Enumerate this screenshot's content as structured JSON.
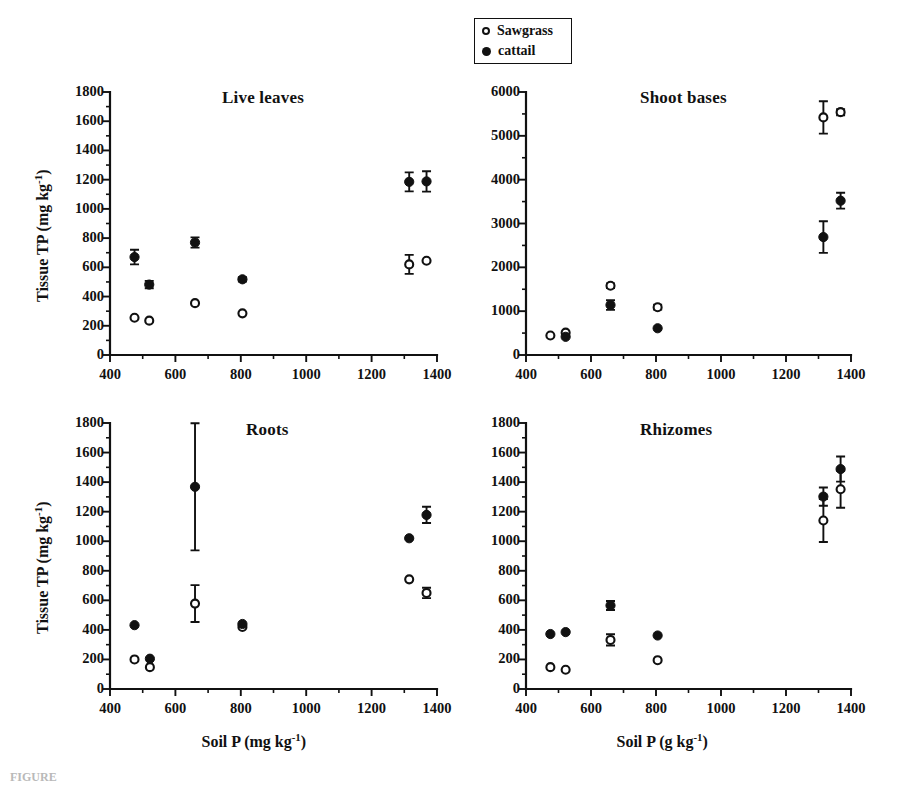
{
  "figure": {
    "caption": "FIGURE",
    "legend": {
      "items": [
        {
          "label": "Sawgrass",
          "marker": "open-circle-marker"
        },
        {
          "label": "cattail",
          "marker": "filled-circle-marker"
        }
      ]
    }
  },
  "chart_data": [
    {
      "type": "scatter",
      "panel_id": "live-leaves",
      "title": "Live leaves",
      "xlabel": "Soil P (mg kg⁻¹)",
      "ylabel": "Tissue TP (mg kg⁻¹)",
      "xlim": [
        400,
        1400
      ],
      "ylim": [
        0,
        1800
      ],
      "xticks": [
        400,
        600,
        800,
        1000,
        1200,
        1400
      ],
      "yticks": [
        0,
        200,
        400,
        600,
        800,
        1000,
        1200,
        1400,
        1600,
        1800
      ],
      "xticklabels": [
        "400",
        "600",
        "800",
        "1000",
        "1200",
        "1400"
      ],
      "yticklabels": [
        "0",
        "200",
        "400",
        "600",
        "800",
        "1000",
        "1200",
        "1400",
        "1600",
        "1800"
      ],
      "grid": false,
      "minor_ticks": true,
      "legend_position": "outside-top-center",
      "series": [
        {
          "name": "Sawgrass",
          "marker": "open-circle",
          "points": [
            {
              "x": 475,
              "y": 255,
              "err": 0
            },
            {
              "x": 520,
              "y": 235,
              "err": 0
            },
            {
              "x": 660,
              "y": 355,
              "err": 0
            },
            {
              "x": 805,
              "y": 285,
              "err": 0
            },
            {
              "x": 1315,
              "y": 620,
              "err": 65
            },
            {
              "x": 1368,
              "y": 645,
              "err": 0
            }
          ]
        },
        {
          "name": "cattail",
          "marker": "filled-circle",
          "points": [
            {
              "x": 475,
              "y": 670,
              "err": 50
            },
            {
              "x": 520,
              "y": 482,
              "err": 25
            },
            {
              "x": 660,
              "y": 770,
              "err": 35
            },
            {
              "x": 805,
              "y": 518,
              "err": 15
            },
            {
              "x": 1315,
              "y": 1185,
              "err": 65
            },
            {
              "x": 1368,
              "y": 1188,
              "err": 70
            }
          ]
        }
      ]
    },
    {
      "type": "scatter",
      "panel_id": "shoot-bases",
      "title": "Shoot bases",
      "xlabel": "Soil P (g kg⁻¹)",
      "ylabel": "",
      "xlim": [
        400,
        1400
      ],
      "ylim": [
        0,
        6000
      ],
      "xticks": [
        400,
        600,
        800,
        1000,
        1200,
        1400
      ],
      "yticks": [
        0,
        1000,
        2000,
        3000,
        4000,
        5000,
        6000
      ],
      "xticklabels": [
        "400",
        "600",
        "800",
        "1000",
        "1200",
        "1400"
      ],
      "yticklabels": [
        "0",
        "1000",
        "2000",
        "3000",
        "4000",
        "5000",
        "6000"
      ],
      "grid": false,
      "minor_ticks": true,
      "series": [
        {
          "name": "Sawgrass",
          "marker": "open-circle",
          "points": [
            {
              "x": 475,
              "y": 445,
              "err": 0
            },
            {
              "x": 522,
              "y": 510,
              "err": 0
            },
            {
              "x": 660,
              "y": 1580,
              "err": 55
            },
            {
              "x": 805,
              "y": 1090,
              "err": 55
            },
            {
              "x": 1315,
              "y": 5420,
              "err": 370
            },
            {
              "x": 1368,
              "y": 5540,
              "err": 70
            }
          ]
        },
        {
          "name": "cattail",
          "marker": "filled-circle",
          "points": [
            {
              "x": 522,
              "y": 415,
              "err": 0
            },
            {
              "x": 660,
              "y": 1140,
              "err": 110
            },
            {
              "x": 805,
              "y": 610,
              "err": 0
            },
            {
              "x": 1315,
              "y": 2690,
              "err": 360
            },
            {
              "x": 1368,
              "y": 3520,
              "err": 180
            }
          ]
        }
      ]
    },
    {
      "type": "scatter",
      "panel_id": "roots",
      "title": "Roots",
      "xlabel": "Soil P (mg kg⁻¹)",
      "ylabel": "Tissue TP (mg kg⁻¹)",
      "xlim": [
        400,
        1400
      ],
      "ylim": [
        0,
        1800
      ],
      "xticks": [
        400,
        600,
        800,
        1000,
        1200,
        1400
      ],
      "yticks": [
        0,
        200,
        400,
        600,
        800,
        1000,
        1200,
        1400,
        1600,
        1800
      ],
      "xticklabels": [
        "400",
        "600",
        "800",
        "1000",
        "1200",
        "1400"
      ],
      "yticklabels": [
        "0",
        "200",
        "400",
        "600",
        "800",
        "1000",
        "1200",
        "1400",
        "1600",
        "1800"
      ],
      "grid": false,
      "minor_ticks": true,
      "series": [
        {
          "name": "Sawgrass",
          "marker": "open-circle",
          "points": [
            {
              "x": 475,
              "y": 200,
              "err": 0
            },
            {
              "x": 522,
              "y": 148,
              "err": 0
            },
            {
              "x": 660,
              "y": 578,
              "err": 125
            },
            {
              "x": 805,
              "y": 420,
              "err": 0
            },
            {
              "x": 1315,
              "y": 742,
              "err": 0
            },
            {
              "x": 1368,
              "y": 650,
              "err": 35
            }
          ]
        },
        {
          "name": "cattail",
          "marker": "filled-circle",
          "points": [
            {
              "x": 475,
              "y": 432,
              "err": 0
            },
            {
              "x": 522,
              "y": 205,
              "err": 0
            },
            {
              "x": 660,
              "y": 1368,
              "err": 430
            },
            {
              "x": 805,
              "y": 440,
              "err": 0
            },
            {
              "x": 1315,
              "y": 1020,
              "err": 0
            },
            {
              "x": 1368,
              "y": 1178,
              "err": 55
            }
          ]
        }
      ]
    },
    {
      "type": "scatter",
      "panel_id": "rhizomes",
      "title": "Rhizomes",
      "xlabel": "Soil P (g kg⁻¹)",
      "ylabel": "",
      "xlim": [
        400,
        1400
      ],
      "ylim": [
        0,
        1800
      ],
      "xticks": [
        400,
        600,
        800,
        1000,
        1200,
        1400
      ],
      "yticks": [
        0,
        200,
        400,
        600,
        800,
        1000,
        1200,
        1400,
        1600,
        1800
      ],
      "xticklabels": [
        "400",
        "600",
        "800",
        "1000",
        "1200",
        "1400"
      ],
      "yticklabels": [
        "0",
        "200",
        "400",
        "600",
        "800",
        "1000",
        "1200",
        "1400",
        "1600",
        "1800"
      ],
      "grid": false,
      "minor_ticks": true,
      "series": [
        {
          "name": "Sawgrass",
          "marker": "open-circle",
          "points": [
            {
              "x": 475,
              "y": 148,
              "err": 0
            },
            {
              "x": 522,
              "y": 130,
              "err": 0
            },
            {
              "x": 660,
              "y": 332,
              "err": 38
            },
            {
              "x": 805,
              "y": 195,
              "err": 0
            },
            {
              "x": 1315,
              "y": 1140,
              "err": 145
            },
            {
              "x": 1368,
              "y": 1352,
              "err": 125
            }
          ]
        },
        {
          "name": "cattail",
          "marker": "filled-circle",
          "points": [
            {
              "x": 475,
              "y": 372,
              "err": 0
            },
            {
              "x": 522,
              "y": 385,
              "err": 0
            },
            {
              "x": 660,
              "y": 565,
              "err": 30
            },
            {
              "x": 805,
              "y": 362,
              "err": 0
            },
            {
              "x": 1315,
              "y": 1302,
              "err": 62
            },
            {
              "x": 1368,
              "y": 1488,
              "err": 85
            }
          ]
        }
      ]
    }
  ],
  "panel_geometry": [
    {
      "id": "live-leaves",
      "left": 110,
      "top": 92,
      "right": 437,
      "bottom": 355,
      "title_x": 222,
      "title_y": 88
    },
    {
      "id": "shoot-bases",
      "left": 526,
      "top": 92,
      "right": 851,
      "bottom": 355,
      "title_x": 640,
      "title_y": 88
    },
    {
      "id": "roots",
      "left": 110,
      "top": 423,
      "right": 437,
      "bottom": 689,
      "title_x": 246,
      "title_y": 420
    },
    {
      "id": "rhizomes",
      "left": 526,
      "top": 423,
      "right": 851,
      "bottom": 689,
      "title_x": 640,
      "title_y": 420
    }
  ]
}
